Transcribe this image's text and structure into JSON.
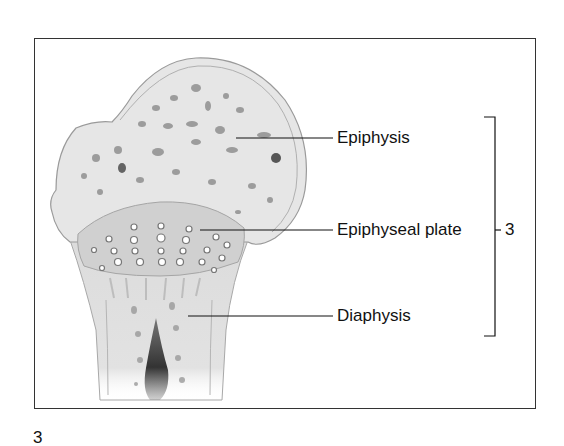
{
  "figure": {
    "number": "3",
    "labels": {
      "epiphysis": "Epiphysis",
      "epiphyseal_plate": "Epiphyseal plate",
      "diaphysis": "Diaphysis"
    },
    "bracket_label": "3"
  },
  "colors": {
    "text": "#111111",
    "frame": "#333333",
    "bone_fill": "#e4e4e4",
    "bone_outline": "#9a9a9a",
    "plate_fill": "#cfcfcf",
    "marrow": "#3a3a3a"
  }
}
